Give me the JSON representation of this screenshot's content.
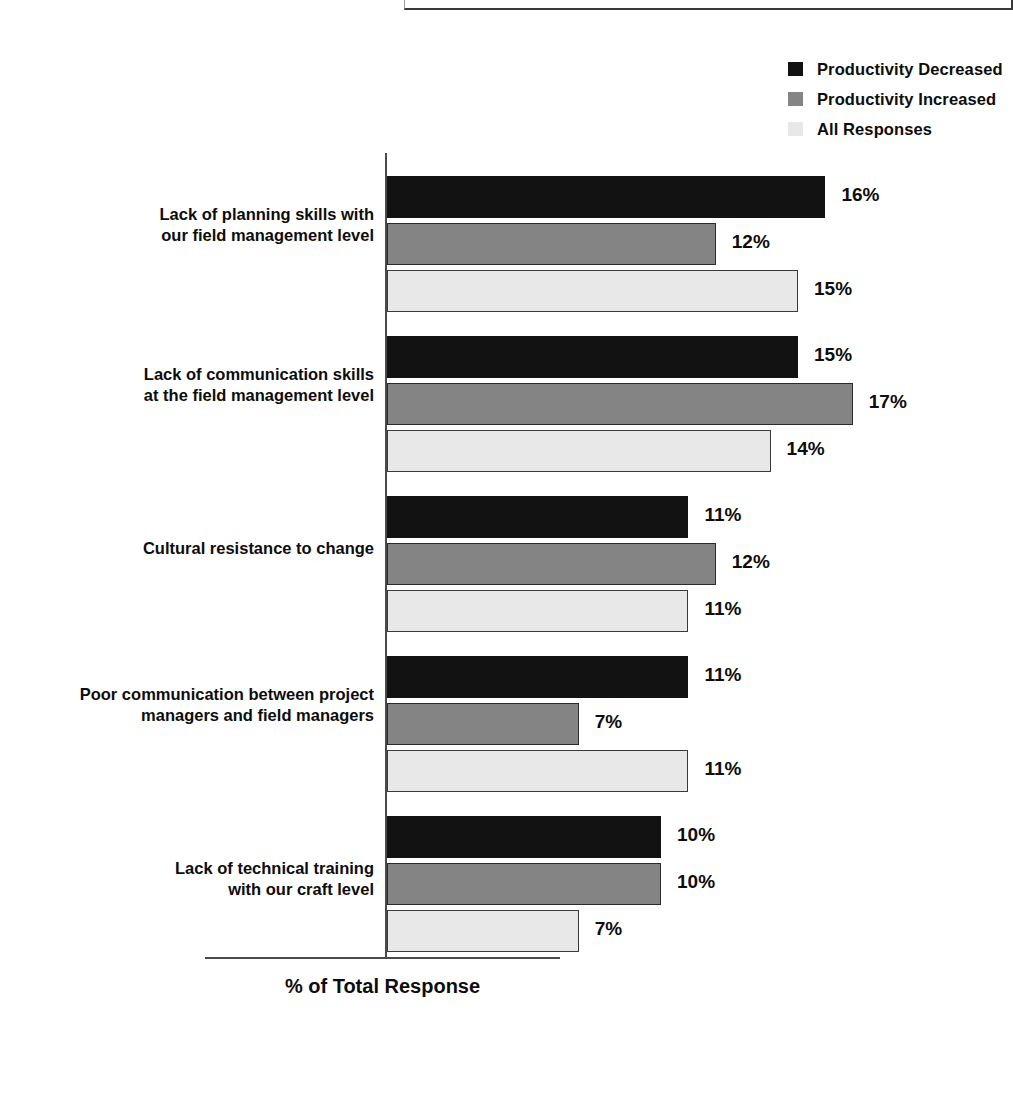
{
  "chart_data": {
    "type": "bar",
    "orientation": "horizontal",
    "title": "",
    "xlabel": "% of Total Response",
    "ylabel": "",
    "xlim": [
      0,
      18
    ],
    "grid": false,
    "legend_position": "top-right",
    "value_suffix": "%",
    "categories": [
      "Lack of planning skills with\nour field management level",
      "Lack of communication skills\nat the field management level",
      "Cultural resistance to change",
      "Poor communication between project\nmanagers and field managers",
      "Lack of technical training\nwith our craft level"
    ],
    "series": [
      {
        "name": "Productivity Decreased",
        "color": "#121212",
        "values": [
          16,
          15,
          11,
          11,
          10
        ],
        "labels": [
          "16%",
          "15%",
          "11%",
          "11%",
          "10%"
        ]
      },
      {
        "name": "Productivity Increased",
        "color": "#848484",
        "values": [
          12,
          17,
          12,
          7,
          10
        ],
        "labels": [
          "12%",
          "17%",
          "12%",
          "7%",
          "10%"
        ]
      },
      {
        "name": "All Responses",
        "color": "#e8e8e8",
        "values": [
          15,
          14,
          11,
          11,
          7
        ],
        "labels": [
          "15%",
          "14%",
          "11%",
          "11%",
          "7%"
        ]
      }
    ]
  },
  "legend": {
    "items": [
      {
        "label": "Productivity Decreased",
        "color": "#121212"
      },
      {
        "label": "Productivity Increased",
        "color": "#848484"
      },
      {
        "label": "All Responses",
        "color": "#e8e8e8"
      }
    ]
  },
  "axis": {
    "x_title": "% of Total Response"
  }
}
